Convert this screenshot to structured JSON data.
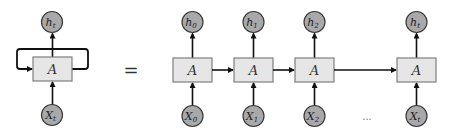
{
  "diagram": {
    "type": "rnn-unrolled",
    "colors": {
      "cell_fill": "#e6e6e6",
      "cell_stroke": "#7f7f7f",
      "node_fill": "#a9a9a9",
      "node_stroke": "#3a3a3a",
      "arrow": "#111111"
    },
    "rolled": {
      "cell": {
        "label": "A",
        "x": 33,
        "y": 57,
        "w": 39,
        "h": 24
      },
      "output": {
        "base": "h",
        "sub": "t",
        "cx": 52,
        "cy": 22
      },
      "input": {
        "base": "X",
        "sub": "t",
        "cx": 52,
        "cy": 115
      },
      "loop": {
        "left_x": 17,
        "right_x": 88,
        "top_y": 49
      }
    },
    "equals": {
      "label": "=",
      "x": 131,
      "y": 76
    },
    "unrolled": [
      {
        "cell": {
          "label": "A",
          "x": 173,
          "y": 58,
          "w": 39,
          "h": 24
        },
        "output": {
          "base": "h",
          "sub": "0"
        },
        "input": {
          "base": "X",
          "sub": "0"
        }
      },
      {
        "cell": {
          "label": "A",
          "x": 234,
          "y": 58,
          "w": 39,
          "h": 24
        },
        "output": {
          "base": "h",
          "sub": "1"
        },
        "input": {
          "base": "X",
          "sub": "1"
        }
      },
      {
        "cell": {
          "label": "A",
          "x": 295,
          "y": 58,
          "w": 39,
          "h": 24
        },
        "output": {
          "base": "h",
          "sub": "2"
        },
        "input": {
          "base": "X",
          "sub": "2"
        }
      },
      {
        "cell": {
          "label": "A",
          "x": 397,
          "y": 58,
          "w": 39,
          "h": 24
        },
        "output": {
          "base": "h",
          "sub": "t"
        },
        "input": {
          "base": "X",
          "sub": "t"
        }
      }
    ],
    "ellipsis": {
      "label": "...",
      "x": 367,
      "y": 120
    }
  }
}
